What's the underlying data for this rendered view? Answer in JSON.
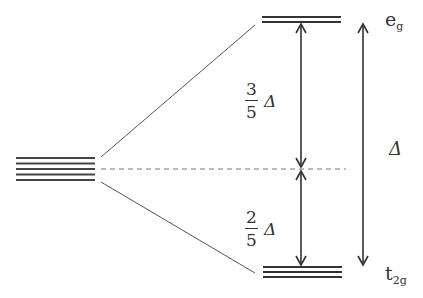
{
  "diagram": {
    "type": "crystal-field-splitting",
    "degenerate_levels": {
      "count": 5
    },
    "upper_set": {
      "label_main": "e",
      "label_sub": "g",
      "line_count": 2
    },
    "lower_set": {
      "label_main": "t",
      "label_sub": "2g",
      "line_count": 3
    },
    "upper_gap": {
      "numerator": "3",
      "denominator": "5",
      "symbol": "Δ"
    },
    "lower_gap": {
      "numerator": "2",
      "denominator": "5",
      "symbol": "Δ"
    },
    "total_gap": {
      "symbol": "Δ"
    },
    "colors": {
      "line": "#333333",
      "thin_line": "#555555",
      "dashed": "#777777"
    }
  }
}
